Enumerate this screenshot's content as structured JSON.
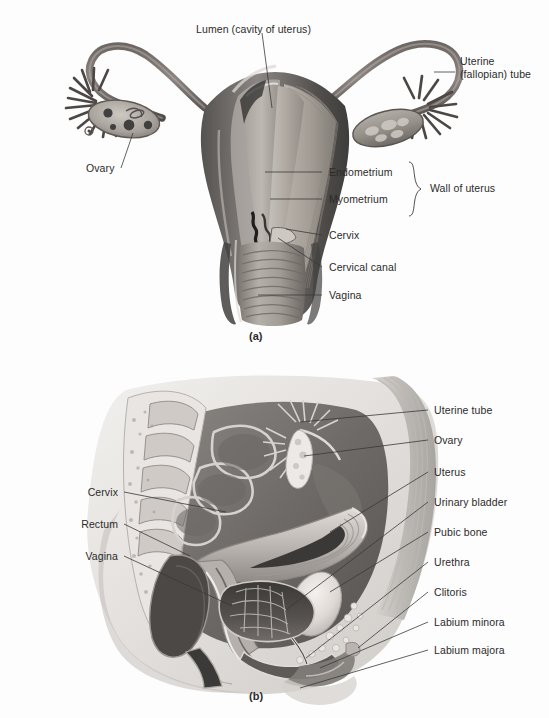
{
  "figure": {
    "background_color": "#fdfdfd",
    "ink_color": "#2b2b2b",
    "leader_color": "#3a3a3a"
  },
  "panel_a": {
    "caption": "(a)",
    "view": "anterior view, frontal section of uterus, uterine tubes and ovaries",
    "labels": {
      "lumen": "Lumen (cavity of uterus)",
      "uterine_tube": "Uterine\n(fallopian) tube",
      "uterine_tube_line1": "Uterine",
      "uterine_tube_line2": "(fallopian) tube",
      "ovary": "Ovary",
      "endometrium": "Endometrium",
      "myometrium": "Myometrium",
      "wall_of_uterus": "Wall of uterus",
      "cervix": "Cervix",
      "cervical_canal": "Cervical canal",
      "vagina": "Vagina"
    }
  },
  "panel_b": {
    "caption": "(b)",
    "view": "midsagittal section of female pelvis",
    "labels_right": [
      "Uterine tube",
      "Ovary",
      "Uterus",
      "Urinary bladder",
      "Pubic bone",
      "Urethra",
      "Clitoris",
      "Labium minora",
      "Labium majora"
    ],
    "labels_left": [
      "Cervix",
      "Rectum",
      "Vagina"
    ]
  }
}
